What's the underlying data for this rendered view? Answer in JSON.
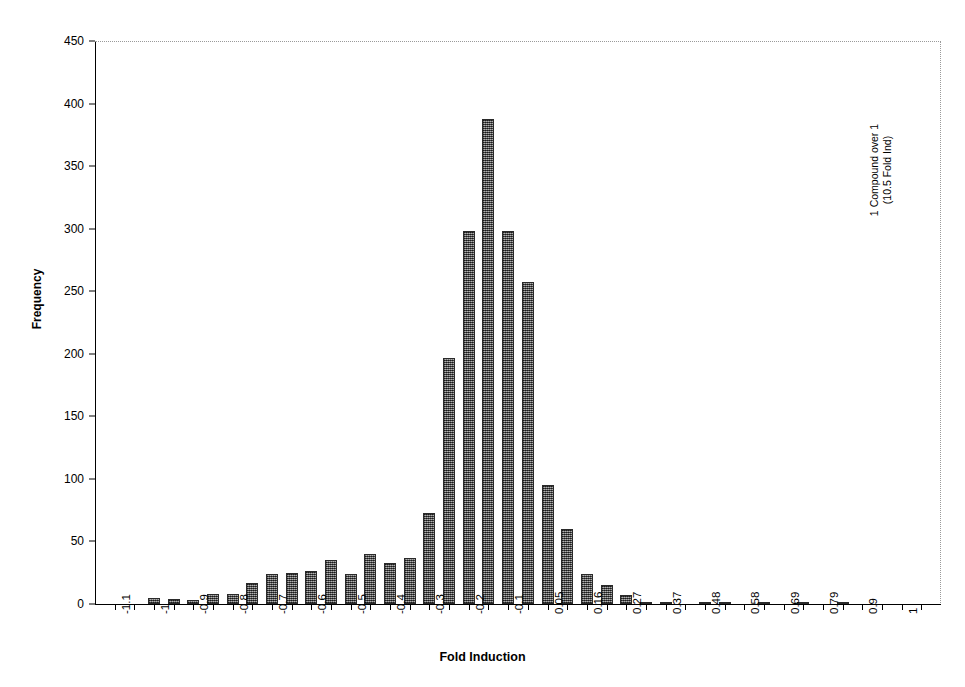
{
  "chart_data": {
    "type": "bar",
    "title": "",
    "subtitle": "",
    "xlabel": "Fold Induction",
    "ylabel": "Frequency",
    "xlim": [
      -1.15,
      1.0
    ],
    "ylim": [
      0,
      450
    ],
    "grid": false,
    "legend": null,
    "bar_color": "#6e6e6e",
    "bar_edge_color": "#2a2a2a",
    "frame_color": "#9a9a9a",
    "axis_color": "#000000",
    "y_ticks": [
      0,
      50,
      100,
      150,
      200,
      250,
      300,
      350,
      400,
      450
    ],
    "y_ticklabels": [
      "0",
      "50",
      "100",
      "150",
      "200",
      "250",
      "300",
      "350",
      "400",
      "450"
    ],
    "x_ticklabels": [
      "-1.1",
      "",
      "-1",
      "",
      "-0.9",
      "",
      "-0.8",
      "",
      "-0.7",
      "",
      "-0.6",
      "",
      "-0.5",
      "",
      "-0.4",
      "",
      "-0.3",
      "",
      "-0.2",
      "",
      "-0.1",
      "",
      "0.05",
      "",
      "0.16",
      "",
      "0.27",
      "",
      "0.37",
      "",
      "0.48",
      "",
      "0.58",
      "",
      "0.69",
      "",
      "0.79",
      "",
      "0.9",
      "",
      "1",
      ""
    ],
    "categories": [
      "-1.15",
      "-1.1",
      "-1.05",
      "-1",
      "-0.95",
      "-0.9",
      "-0.85",
      "-0.8",
      "-0.75",
      "-0.7",
      "-0.65",
      "-0.6",
      "-0.55",
      "-0.5",
      "-0.45",
      "-0.4",
      "-0.35",
      "-0.3",
      "-0.25",
      "-0.2",
      "-0.15",
      "-0.1",
      "-0.05",
      "0.05",
      "0.1",
      "0.16",
      "0.21",
      "0.27",
      "0.32",
      "0.37",
      "0.42",
      "0.48",
      "0.53",
      "0.58",
      "0.64",
      "0.69",
      "0.74",
      "0.79",
      "0.85",
      "0.9",
      "0.95",
      "1"
    ],
    "values": [
      0,
      0,
      5,
      4,
      3,
      8,
      8,
      17,
      24,
      25,
      26,
      35,
      24,
      40,
      33,
      37,
      73,
      197,
      298,
      388,
      298,
      257,
      95,
      60,
      24,
      15,
      7,
      2,
      1,
      0,
      1,
      1,
      0,
      1,
      0,
      1,
      0,
      1,
      0,
      0,
      0,
      0
    ],
    "annotations": [
      {
        "text_line_1": "1 Compound over 1",
        "text_line_2": "(10.5 Fold Ind)",
        "rotation": 90,
        "position": "right-middle"
      }
    ]
  }
}
